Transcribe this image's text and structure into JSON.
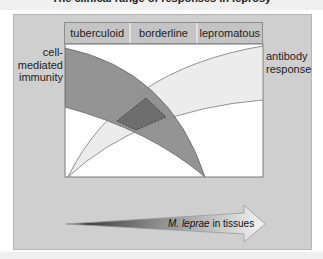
{
  "title": "The clinical range of responses in leprosy",
  "header": {
    "columns": [
      "tuberculoid",
      "borderline",
      "lepromatous"
    ]
  },
  "labels": {
    "left": "cell-mediated immunity",
    "left_lines": [
      "cell-",
      "mediated",
      "immunity"
    ],
    "right_lines": [
      "antibody",
      "response"
    ]
  },
  "arrow": {
    "label_italic": "M. leprae",
    "label_rest": " in tissues"
  },
  "colors": {
    "panel": "#cfcfcf",
    "cell_mediated_band": "#8e8e8e",
    "antibody_band": "#ececec",
    "overlap": "#6e6e6e"
  }
}
